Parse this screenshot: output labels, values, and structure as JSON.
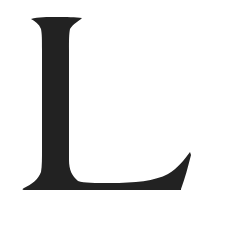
{
  "image": {
    "description": "Single serif capital letter glyph on white background",
    "glyph": "L",
    "colors": {
      "glyph": "#222222",
      "background": "#ffffff"
    }
  }
}
